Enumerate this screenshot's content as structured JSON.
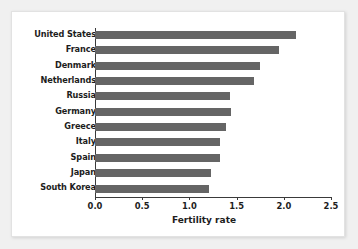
{
  "chart_data": {
    "type": "bar",
    "orientation": "horizontal",
    "title": "",
    "xlabel": "Fertility rate",
    "ylabel": "",
    "categories": [
      "United States",
      "France",
      "Denmark",
      "Netherlands",
      "Russia",
      "Germany",
      "Greece",
      "Italy",
      "Spain",
      "Japan",
      "South Korea"
    ],
    "values": [
      2.13,
      1.95,
      1.75,
      1.68,
      1.43,
      1.44,
      1.39,
      1.32,
      1.32,
      1.23,
      1.21
    ],
    "xlim": [
      0.0,
      2.5
    ],
    "xticks": [
      0.0,
      0.5,
      1.0,
      1.5,
      2.0,
      2.5
    ],
    "xtick_labels": [
      "0.0",
      "0.5",
      "1.0",
      "1.5",
      "2.0",
      "2.5"
    ],
    "grid": false,
    "legend": null,
    "bar_color": "#656565",
    "axis_color": "#3a3a3a",
    "background_color": "#ffffff"
  }
}
